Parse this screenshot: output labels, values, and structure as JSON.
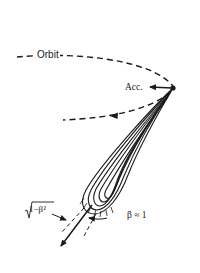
{
  "diagram": {
    "labels": {
      "orbit": "Orbit",
      "acceleration": "Acc.",
      "beta_condition": "β ≈ 1",
      "opening_angle": "√1−β²",
      "opening_angle_radicand": "1−β²"
    },
    "elements": {
      "orbit_path": "dashed curved orbit of the charge",
      "acceleration_vector": "arrow pointing toward orbit center",
      "radiation_lobe": "narrow forward-directed emission lobe",
      "velocity_arrow": "arrow along direction of motion",
      "cone_boundaries": "dashed lines marking opening angle"
    },
    "colors": {
      "ink": "#1a1a1a",
      "background": "#ffffff"
    }
  }
}
